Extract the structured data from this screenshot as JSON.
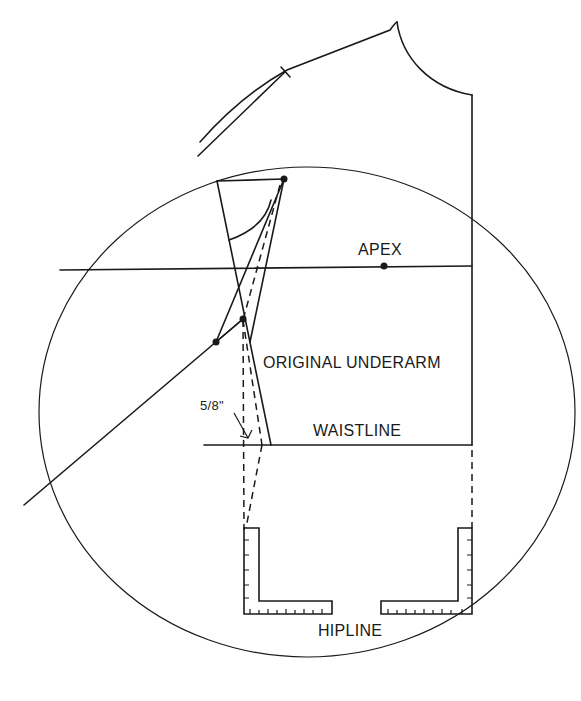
{
  "diagram": {
    "type": "pattern-drafting",
    "labels": {
      "apex": "APEX",
      "original_underarm": "ORIGINAL UNDERARM",
      "waistline": "WAISTLINE",
      "hipline": "HIPLINE",
      "measurement": "5/8\""
    },
    "colors": {
      "line": "#1a1a1a",
      "background": "#ffffff"
    }
  }
}
